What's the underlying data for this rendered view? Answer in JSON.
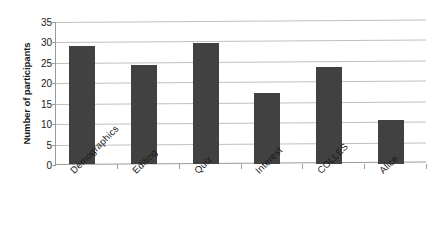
{
  "chart_data": {
    "type": "bar",
    "title": "",
    "xlabel": "",
    "ylabel": "Number of participants",
    "categories": [
      "Demographics",
      "Editing",
      "Quiz",
      "Interest",
      "COLLES",
      "Alice"
    ],
    "values": [
      29,
      24.3,
      29.5,
      17.5,
      23.7,
      10.7
    ],
    "ylim": [
      0,
      35
    ],
    "ytick_labels": [
      "0",
      "5",
      "10",
      "15",
      "20",
      "25",
      "30",
      "35"
    ],
    "ytick_values": [
      0,
      5,
      10,
      15,
      20,
      25,
      30,
      35
    ],
    "grid": true,
    "legend": false,
    "bar_color": "#414141",
    "gridline_color": "#c0c0c0",
    "axis_color": "#9a9a9a",
    "background_color": "#ffffff"
  }
}
